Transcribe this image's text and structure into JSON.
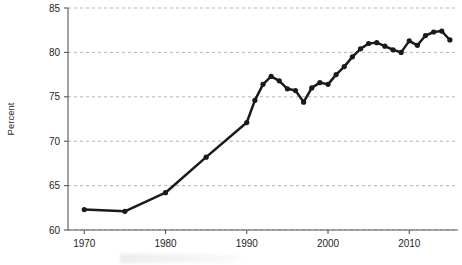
{
  "chart_data": {
    "type": "line",
    "title": "",
    "subtitle": "",
    "xlabel": "",
    "ylabel": "Percent",
    "xlim": [
      1968,
      2016
    ],
    "ylim": [
      60,
      85
    ],
    "xticks": [
      1970,
      1980,
      1990,
      2000,
      2010
    ],
    "xtick_labels": [
      "1970",
      "1980",
      "1990",
      "2000",
      "2010"
    ],
    "yticks": [
      60,
      65,
      70,
      75,
      80,
      85
    ],
    "ytick_labels": [
      "60",
      "65",
      "70",
      "75",
      "80",
      "85"
    ],
    "grid": "horizontal-dashed",
    "legend": "none",
    "line_color": "#1a1a1a",
    "marker": "circle",
    "marker_color": "#1a1a1a",
    "axis_color": "#555555",
    "grid_color": "#aaaaaa",
    "background": "#ffffff",
    "series": [
      {
        "name": "Percent",
        "x": [
          1970,
          1975,
          1980,
          1985,
          1990,
          1991,
          1992,
          1993,
          1994,
          1995,
          1996,
          1997,
          1998,
          1999,
          2000,
          2001,
          2002,
          2003,
          2004,
          2005,
          2006,
          2007,
          2008,
          2009,
          2010,
          2011,
          2012,
          2013,
          2014,
          2015
        ],
        "values": [
          62.3,
          62.1,
          64.2,
          68.2,
          72.1,
          74.6,
          76.4,
          77.3,
          76.8,
          75.9,
          75.7,
          74.4,
          76.0,
          76.6,
          76.4,
          77.5,
          78.4,
          79.5,
          80.4,
          81.0,
          81.1,
          80.7,
          80.3,
          80.0,
          81.3,
          80.8,
          81.9,
          82.3,
          82.4,
          81.4
        ]
      }
    ],
    "annotations": []
  },
  "figure": {
    "note_visible_text": ""
  }
}
